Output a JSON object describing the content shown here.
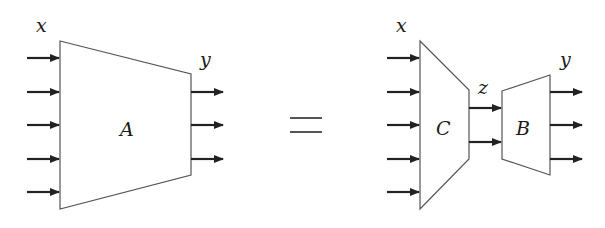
{
  "diagram": {
    "left": {
      "block_label": "A",
      "input_label": "x",
      "output_label": "y",
      "input_count": 5,
      "output_count": 3
    },
    "relation_symbol": "=",
    "right": {
      "encoder_label": "C",
      "decoder_label": "B",
      "input_label": "x",
      "latent_label": "z",
      "output_label": "y",
      "input_count": 5,
      "latent_count": 2,
      "output_count": 3
    },
    "colors": {
      "outline": "#555555",
      "arrow": "#222222",
      "background": "#ffffff"
    }
  }
}
